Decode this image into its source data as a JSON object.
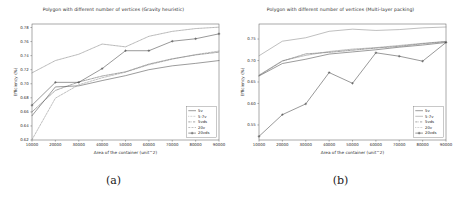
{
  "figure": {
    "captions": [
      "(a)",
      "(b)"
    ]
  },
  "chart_data": [
    {
      "type": "line",
      "title": "Polygon with different number of vertices (Gravity heuristic)",
      "xlabel": "Area of the container (unit^2)",
      "ylabel": "Efficiency (%)",
      "xlim": [
        10000,
        90000
      ],
      "ylim": [
        0.62,
        0.785
      ],
      "xticks": [
        10000,
        20000,
        30000,
        40000,
        50000,
        60000,
        70000,
        80000,
        90000
      ],
      "xtick_labels": [
        "10000",
        "20000",
        "30000",
        "40000",
        "50000",
        "60000",
        "70000",
        "80000",
        "90000"
      ],
      "yticks": [
        0.62,
        0.64,
        0.66,
        0.68,
        0.7,
        0.72,
        0.74,
        0.76,
        0.78
      ],
      "ytick_labels": [
        "0.62",
        "0.64",
        "0.66",
        "0.68",
        "0.70",
        "0.72",
        "0.74",
        "0.76",
        "0.78"
      ],
      "grid": false,
      "legend_position": "lower right",
      "x": [
        10000,
        20000,
        30000,
        40000,
        50000,
        60000,
        70000,
        80000,
        90000
      ],
      "series": [
        {
          "name": "5v",
          "color": "#4a4a4a",
          "dash": "none",
          "marker": "none",
          "values": [
            0.6545,
            0.6955,
            0.697,
            0.7045,
            0.7115,
            0.72,
            0.7255,
            0.729,
            0.733
          ]
        },
        {
          "name": "5-7v",
          "color": "#7a7a7a",
          "dash": "dotted",
          "marker": "none",
          "values": [
            0.7155,
            0.733,
            0.742,
            0.7565,
            0.7525,
            0.7675,
            0.7745,
            0.7785,
            0.7805
          ]
        },
        {
          "name": "5vds",
          "color": "#5c5c5c",
          "dash": "dashdot",
          "marker": "none",
          "values": [
            0.66,
            0.6905,
            0.7025,
            0.711,
            0.717,
            0.728,
            0.7355,
            0.741,
            0.745
          ]
        },
        {
          "name": "20v",
          "color": "#8c8c8c",
          "dash": "dashed",
          "marker": "none",
          "values": [
            0.6205,
            0.6795,
            0.6985,
            0.7085,
            0.7165,
            0.727,
            0.735,
            0.7415,
            0.7465
          ]
        },
        {
          "name": "20vds",
          "color": "#444444",
          "dash": "none",
          "marker": "plus",
          "values": [
            0.6695,
            0.702,
            0.702,
            0.7215,
            0.747,
            0.747,
            0.7605,
            0.764,
            0.771
          ]
        }
      ]
    },
    {
      "type": "line",
      "title": "Polygon with different number of vertices (Multi-layer packing)",
      "xlabel": "Area of the container (unit^2)",
      "ylabel": "Efficiency (%)",
      "xlim": [
        10000,
        90000
      ],
      "ylim": [
        0.515,
        0.785
      ],
      "xticks": [
        10000,
        20000,
        30000,
        40000,
        50000,
        60000,
        70000,
        80000,
        90000
      ],
      "xtick_labels": [
        "10000",
        "20000",
        "30000",
        "40000",
        "50000",
        "60000",
        "70000",
        "80000",
        "90000"
      ],
      "yticks": [
        0.55,
        0.6,
        0.65,
        0.7,
        0.75
      ],
      "ytick_labels": [
        "0.55",
        "0.60",
        "0.65",
        "0.70",
        "0.75"
      ],
      "grid": false,
      "legend_position": "lower right",
      "x": [
        10000,
        20000,
        30000,
        40000,
        50000,
        60000,
        70000,
        80000,
        90000
      ],
      "series": [
        {
          "name": "5v",
          "color": "#4a4a4a",
          "dash": "none",
          "marker": "none",
          "values": [
            0.664,
            0.693,
            0.703,
            0.715,
            0.72,
            0.725,
            0.731,
            0.736,
            0.742
          ]
        },
        {
          "name": "5-7v",
          "color": "#8a8a8a",
          "dash": "solid",
          "marker": "none",
          "values": [
            0.711,
            0.745,
            0.753,
            0.768,
            0.773,
            0.77,
            0.772,
            0.776,
            0.778
          ]
        },
        {
          "name": "5vds",
          "color": "#5c5c5c",
          "dash": "dashdot",
          "marker": "none",
          "values": [
            0.665,
            0.6985,
            0.7155,
            0.719,
            0.724,
            0.729,
            0.733,
            0.739,
            0.744
          ]
        },
        {
          "name": "20v",
          "color": "#7c7c7c",
          "dash": "dotted",
          "marker": "none",
          "values": [
            0.666,
            0.6995,
            0.712,
            0.721,
            0.7265,
            0.73,
            0.735,
            0.74,
            0.7445
          ]
        },
        {
          "name": "20vds",
          "color": "#444444",
          "dash": "none",
          "marker": "plus",
          "values": [
            0.5235,
            0.574,
            0.599,
            0.672,
            0.647,
            0.718,
            0.71,
            0.6985,
            0.742
          ]
        }
      ]
    }
  ]
}
